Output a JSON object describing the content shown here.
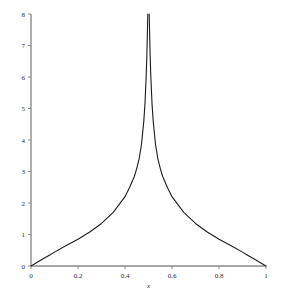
{
  "chart_data": {
    "type": "line",
    "title": "",
    "subtitle": "",
    "xlabel": "x",
    "ylabel": "",
    "xlim": [
      0,
      1
    ],
    "ylim": [
      0,
      8
    ],
    "grid": false,
    "legend": null,
    "xticks": [
      0,
      0.2,
      0.4,
      0.6,
      0.8,
      1
    ],
    "xtick_labels": [
      "0",
      "0.2",
      "0.4",
      "0.6",
      "0.8",
      "1"
    ],
    "yticks": [
      0,
      1,
      2,
      3,
      4,
      5,
      6,
      7,
      8
    ],
    "ytick_labels": [
      "0",
      "1",
      "2",
      "3",
      "4",
      "5",
      "6",
      "7",
      "8"
    ],
    "curve_color": "#1c1c1c",
    "axis_color": "#8a8a8a",
    "background": "#ffffff",
    "annotations": [],
    "series": [
      {
        "name": "f(x)",
        "description": "symmetric curve with vertical asymptote at x = 0.5, clipped at y = 8",
        "asymptote_x": 0.5,
        "x": [
          0.0,
          0.02,
          0.05,
          0.08,
          0.1,
          0.15,
          0.2,
          0.25,
          0.3,
          0.35,
          0.4,
          0.42,
          0.44,
          0.45,
          0.46,
          0.47,
          0.48,
          0.485,
          0.49,
          0.493,
          0.495,
          0.497,
          0.503,
          0.505,
          0.507,
          0.51,
          0.515,
          0.52,
          0.53,
          0.54,
          0.55,
          0.56,
          0.58,
          0.6,
          0.65,
          0.7,
          0.75,
          0.8,
          0.85,
          0.9,
          0.92,
          0.95,
          0.98,
          1.0
        ],
        "y": [
          0.0,
          0.09,
          0.22,
          0.35,
          0.44,
          0.65,
          0.85,
          1.08,
          1.35,
          1.7,
          2.2,
          2.5,
          2.85,
          3.1,
          3.4,
          3.85,
          4.6,
          5.15,
          6.0,
          6.7,
          7.3,
          8.0,
          8.0,
          7.3,
          6.7,
          6.0,
          5.15,
          4.6,
          3.85,
          3.4,
          3.1,
          2.85,
          2.5,
          2.2,
          1.7,
          1.35,
          1.08,
          0.85,
          0.65,
          0.44,
          0.35,
          0.22,
          0.09,
          0.0
        ]
      }
    ]
  },
  "figure": {
    "name": "function-plot"
  }
}
